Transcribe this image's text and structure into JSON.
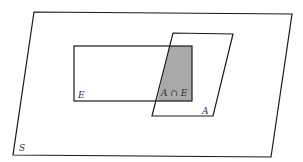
{
  "diagram": {
    "type": "venn-set-diagram",
    "colors": {
      "background": "#ffffff",
      "stroke": "#1a1a1a",
      "intersection_fill": "#a9a9a9",
      "label": "#333333"
    },
    "sets": {
      "S": {
        "label": "S",
        "shape": "parallelogram",
        "description": "sample space"
      },
      "E": {
        "label": "E",
        "shape": "rectangle"
      },
      "A": {
        "label": "A",
        "shape": "parallelogram"
      }
    },
    "intersection": {
      "label": "A ∩ E",
      "shaded": true
    }
  }
}
